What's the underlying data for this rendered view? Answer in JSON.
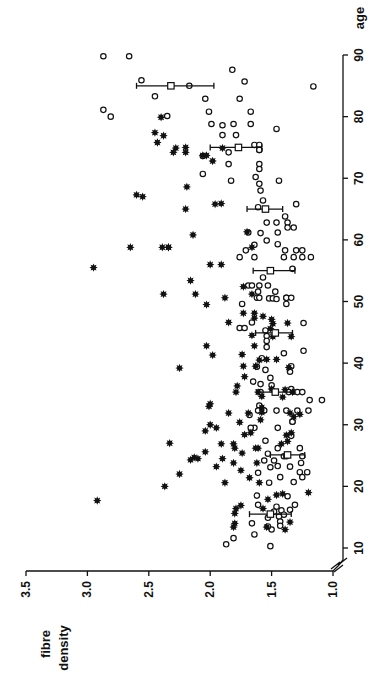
{
  "chart_data": {
    "type": "scatter",
    "orientation": "rotated-90-clockwise",
    "title": "",
    "xlabel": "age",
    "ylabel": "fibre density",
    "xlim": [
      10,
      90
    ],
    "ylim": [
      1.0,
      3.5
    ],
    "y_axis_break": true,
    "grid": false,
    "legend": null,
    "x_ticks": [
      10,
      20,
      30,
      40,
      50,
      60,
      70,
      80,
      90
    ],
    "x_tick_labels": [
      "10",
      "20",
      "30",
      "40",
      "50",
      "60",
      "70",
      "80",
      "90"
    ],
    "y_ticks": [
      1.0,
      1.5,
      2.0,
      2.5,
      3.0,
      3.5
    ],
    "y_tick_labels": [
      "1.0",
      "1.5",
      "2.0",
      "2.5",
      "3.0",
      "3.5"
    ],
    "colors": {
      "ink": "#111111",
      "background": "#ffffff"
    },
    "series": [
      {
        "name": "open circles",
        "marker": "open-circle",
        "points": [
          [
            89.8,
            2.87
          ],
          [
            89.8,
            2.66
          ],
          [
            85.9,
            2.56
          ],
          [
            83.3,
            2.45
          ],
          [
            81.1,
            2.87
          ],
          [
            80.0,
            2.81
          ],
          [
            80.1,
            2.35
          ],
          [
            85.0,
            2.17
          ],
          [
            84.9,
            1.16
          ],
          [
            87.6,
            1.82
          ],
          [
            85.7,
            1.72
          ],
          [
            82.9,
            2.04
          ],
          [
            82.9,
            1.76
          ],
          [
            80.8,
            2.01
          ],
          [
            80.8,
            1.67
          ],
          [
            78.8,
            1.99
          ],
          [
            78.6,
            1.9
          ],
          [
            78.8,
            1.81
          ],
          [
            78.8,
            1.67
          ],
          [
            78.0,
            1.46
          ],
          [
            77.0,
            1.9
          ],
          [
            77.0,
            1.79
          ],
          [
            74.2,
            1.85
          ],
          [
            75.4,
            1.64
          ],
          [
            75.4,
            1.6
          ],
          [
            74.6,
            1.6
          ],
          [
            74.6,
            1.6
          ],
          [
            73.6,
            2.06
          ],
          [
            72.3,
            1.85
          ],
          [
            72.3,
            1.6
          ],
          [
            71.5,
            1.6
          ],
          [
            70.7,
            2.06
          ],
          [
            70.2,
            1.63
          ],
          [
            69.6,
            1.83
          ],
          [
            69.6,
            1.44
          ],
          [
            69.1,
            1.6
          ],
          [
            68.0,
            1.59
          ],
          [
            66.4,
            1.57
          ],
          [
            65.8,
            1.3
          ],
          [
            65.3,
            1.61
          ],
          [
            63.8,
            1.39
          ],
          [
            62.8,
            1.54
          ],
          [
            62.8,
            1.46
          ],
          [
            62.8,
            1.37
          ],
          [
            62.0,
            1.37
          ],
          [
            62.0,
            1.32
          ],
          [
            61.2,
            1.69
          ],
          [
            61.1,
            1.59
          ],
          [
            61.2,
            1.45
          ],
          [
            59.9,
            1.54
          ],
          [
            59.2,
            1.64
          ],
          [
            59.3,
            1.45
          ],
          [
            58.3,
            1.71
          ],
          [
            58.3,
            1.39
          ],
          [
            58.3,
            1.3
          ],
          [
            58.3,
            1.25
          ],
          [
            57.2,
            1.25
          ],
          [
            57.2,
            1.32
          ],
          [
            57.2,
            1.4
          ],
          [
            57.2,
            1.64
          ],
          [
            57.2,
            1.76
          ],
          [
            55.3,
            1.33
          ],
          [
            57.2,
            1.18
          ],
          [
            53.9,
            1.57
          ],
          [
            52.6,
            1.69
          ],
          [
            52.6,
            1.66
          ],
          [
            52.6,
            1.6
          ],
          [
            52.6,
            1.53
          ],
          [
            51.6,
            1.61
          ],
          [
            51.6,
            1.47
          ],
          [
            50.6,
            1.62
          ],
          [
            50.6,
            1.6
          ],
          [
            50.5,
            1.52
          ],
          [
            50.5,
            1.49
          ],
          [
            50.4,
            1.46
          ],
          [
            50.6,
            1.38
          ],
          [
            50.6,
            1.38
          ],
          [
            50.6,
            1.34
          ],
          [
            49.6,
            1.38
          ],
          [
            49.6,
            1.74
          ],
          [
            46.6,
            1.66
          ],
          [
            46.5,
            1.24
          ],
          [
            45.7,
            1.76
          ],
          [
            45.7,
            1.72
          ],
          [
            45.3,
            1.55
          ],
          [
            44.4,
            1.54
          ],
          [
            42.0,
            1.24
          ],
          [
            43.6,
            1.54
          ],
          [
            42.6,
            1.54
          ],
          [
            41.6,
            1.4
          ],
          [
            40.8,
            1.58
          ],
          [
            39.5,
            1.34
          ],
          [
            39.4,
            1.62
          ],
          [
            38.6,
            1.35
          ],
          [
            38.9,
            1.55
          ],
          [
            37.6,
            1.51
          ],
          [
            37.0,
            1.65
          ],
          [
            36.4,
            1.5
          ],
          [
            36.6,
            1.59
          ],
          [
            35.8,
            1.34
          ],
          [
            35.3,
            1.36
          ],
          [
            35.3,
            1.29
          ],
          [
            35.3,
            1.25
          ],
          [
            35.3,
            1.59
          ],
          [
            34.0,
            1.19
          ],
          [
            34.0,
            1.09
          ],
          [
            33.1,
            1.6
          ],
          [
            32.3,
            1.61
          ],
          [
            32.3,
            1.56
          ],
          [
            32.3,
            1.46
          ],
          [
            32.3,
            1.38
          ],
          [
            32.3,
            1.29
          ],
          [
            32.3,
            1.2
          ],
          [
            30.5,
            1.33
          ],
          [
            30.5,
            1.33
          ],
          [
            29.5,
            1.64
          ],
          [
            29.5,
            1.67
          ],
          [
            31.6,
            1.68
          ],
          [
            29.5,
            1.45
          ],
          [
            28.2,
            1.34
          ],
          [
            27.4,
            1.55
          ],
          [
            26.2,
            1.45
          ],
          [
            26.2,
            1.27
          ],
          [
            25.3,
            1.53
          ],
          [
            24.9,
            1.4
          ],
          [
            24.9,
            1.25
          ],
          [
            24.9,
            1.38
          ],
          [
            24.2,
            1.48
          ],
          [
            24.2,
            1.56
          ],
          [
            23.8,
            1.26
          ],
          [
            23.3,
            1.45
          ],
          [
            23.1,
            1.51
          ],
          [
            22.2,
            1.61
          ],
          [
            22.3,
            1.27
          ],
          [
            22.3,
            1.21
          ],
          [
            23.2,
            1.35
          ],
          [
            21.5,
            1.43
          ],
          [
            21.5,
            1.25
          ],
          [
            20.7,
            1.32
          ],
          [
            20.6,
            1.52
          ],
          [
            18.4,
            1.37
          ],
          [
            18.5,
            1.62
          ],
          [
            17.0,
            1.61
          ],
          [
            17.0,
            1.31
          ],
          [
            16.7,
            1.46
          ],
          [
            16.1,
            1.42
          ],
          [
            16.2,
            1.35
          ],
          [
            15.4,
            1.4
          ],
          [
            15.9,
            1.48
          ],
          [
            15.1,
            1.44
          ],
          [
            14.9,
            1.53
          ],
          [
            14.3,
            1.43
          ],
          [
            13.6,
            1.43
          ],
          [
            13.0,
            1.5
          ],
          [
            13.5,
            1.53
          ],
          [
            12.2,
            1.64
          ],
          [
            11.6,
            1.81
          ],
          [
            10.6,
            1.87
          ],
          [
            10.3,
            1.51
          ],
          [
            14.0,
            1.66
          ]
        ]
      },
      {
        "name": "filled stars",
        "marker": "filled-star",
        "points": [
          [
            79.9,
            2.4
          ],
          [
            77.4,
            2.45
          ],
          [
            76.9,
            2.38
          ],
          [
            75.8,
            2.43
          ],
          [
            74.9,
            2.28
          ],
          [
            75.0,
            2.2
          ],
          [
            74.9,
            1.9
          ],
          [
            74.2,
            2.3
          ],
          [
            74.2,
            2.2
          ],
          [
            73.7,
            2.06
          ],
          [
            73.7,
            2.03
          ],
          [
            72.8,
            1.98
          ],
          [
            67.3,
            2.6
          ],
          [
            67.0,
            2.55
          ],
          [
            68.6,
            2.19
          ],
          [
            65.8,
            1.96
          ],
          [
            65.9,
            1.91
          ],
          [
            65.0,
            2.2
          ],
          [
            61.3,
            1.7
          ],
          [
            60.8,
            2.14
          ],
          [
            58.8,
            2.39
          ],
          [
            58.8,
            2.34
          ],
          [
            58.8,
            2.34
          ],
          [
            58.8,
            2.65
          ],
          [
            58.8,
            1.66
          ],
          [
            56.0,
            2.0
          ],
          [
            56.0,
            1.91
          ],
          [
            55.5,
            2.95
          ],
          [
            53.4,
            2.16
          ],
          [
            52.4,
            1.73
          ],
          [
            51.2,
            2.38
          ],
          [
            51.2,
            2.12
          ],
          [
            51.2,
            1.66
          ],
          [
            50.6,
            1.88
          ],
          [
            49.5,
            2.03
          ],
          [
            48.1,
            1.73
          ],
          [
            48.1,
            1.64
          ],
          [
            47.6,
            1.57
          ],
          [
            47.1,
            1.5
          ],
          [
            47.3,
            1.64
          ],
          [
            46.6,
            1.85
          ],
          [
            46.5,
            1.37
          ],
          [
            46.4,
            1.49
          ],
          [
            45.6,
            1.51
          ],
          [
            44.5,
            1.66
          ],
          [
            44.3,
            1.49
          ],
          [
            44.3,
            1.34
          ],
          [
            42.8,
            2.03
          ],
          [
            42.8,
            1.64
          ],
          [
            41.3,
            1.98
          ],
          [
            41.4,
            1.74
          ],
          [
            40.5,
            1.6
          ],
          [
            40.6,
            1.46
          ],
          [
            40.6,
            1.54
          ],
          [
            39.5,
            1.63
          ],
          [
            39.2,
            2.25
          ],
          [
            39.3,
            1.36
          ],
          [
            37.8,
            1.72
          ],
          [
            36.3,
            1.78
          ],
          [
            35.8,
            1.5
          ],
          [
            35.7,
            1.39
          ],
          [
            35.3,
            1.61
          ],
          [
            35.3,
            1.33
          ],
          [
            34.5,
            1.41
          ],
          [
            34.6,
            1.58
          ],
          [
            33.4,
            2.0
          ],
          [
            33.0,
            2.01
          ],
          [
            32.8,
            1.58
          ],
          [
            32.0,
            1.58
          ],
          [
            31.9,
            1.85
          ],
          [
            31.9,
            1.69
          ],
          [
            31.9,
            1.35
          ],
          [
            31.3,
            1.32
          ],
          [
            31.7,
            1.27
          ],
          [
            30.8,
            1.59
          ],
          [
            30.4,
            1.76
          ],
          [
            30.0,
            2.0
          ],
          [
            29.5,
            1.95
          ],
          [
            29.0,
            2.04
          ],
          [
            28.7,
            1.67
          ],
          [
            28.3,
            1.38
          ],
          [
            28.4,
            1.72
          ],
          [
            28.7,
            1.34
          ],
          [
            27.3,
            1.37
          ],
          [
            27.0,
            2.33
          ],
          [
            26.9,
            1.91
          ],
          [
            26.9,
            1.42
          ],
          [
            26.9,
            1.81
          ],
          [
            26.2,
            1.8
          ],
          [
            26.2,
            1.61
          ],
          [
            26.2,
            1.63
          ],
          [
            25.6,
            2.04
          ],
          [
            25.4,
            1.74
          ],
          [
            24.7,
            2.13
          ],
          [
            24.5,
            1.9
          ],
          [
            24.5,
            2.1
          ],
          [
            24.3,
            2.16
          ],
          [
            23.8,
            1.81
          ],
          [
            23.8,
            1.62
          ],
          [
            23.2,
            1.95
          ],
          [
            22.6,
            1.75
          ],
          [
            22.0,
            2.25
          ],
          [
            21.4,
            1.68
          ],
          [
            20.6,
            1.6
          ],
          [
            20.6,
            1.88
          ],
          [
            20.0,
            2.37
          ],
          [
            19.0,
            1.2
          ],
          [
            18.8,
            1.41
          ],
          [
            18.6,
            1.46
          ],
          [
            17.9,
            1.53
          ],
          [
            16.9,
            1.75
          ],
          [
            16.4,
            1.57
          ],
          [
            16.4,
            1.79
          ],
          [
            15.6,
            1.8
          ],
          [
            14.0,
            1.8
          ],
          [
            13.4,
            1.81
          ],
          [
            13.4,
            1.54
          ],
          [
            14.2,
            1.35
          ],
          [
            13.0,
            1.39
          ],
          [
            17.7,
            2.92
          ],
          [
            35.3,
            1.79
          ],
          [
            39.5,
            1.73
          ]
        ]
      },
      {
        "name": "decade means",
        "marker": "open-square",
        "points": [
          [
            15.5,
            1.51
          ],
          [
            25.1,
            1.37
          ],
          [
            35.3,
            1.47
          ],
          [
            44.9,
            1.47
          ],
          [
            55.0,
            1.51
          ],
          [
            65.0,
            1.55
          ],
          [
            75.0,
            1.77
          ],
          [
            85.0,
            2.32
          ]
        ],
        "error_bars": [
          [
            1.34,
            1.68
          ],
          [
            1.23,
            1.51
          ],
          [
            1.32,
            1.62
          ],
          [
            1.33,
            1.63
          ],
          [
            1.31,
            1.65
          ],
          [
            1.41,
            1.7
          ],
          [
            1.58,
            2.0
          ],
          [
            1.97,
            2.6
          ]
        ]
      }
    ]
  },
  "axes": {
    "x_title": "age",
    "y_title_line1": "fibre",
    "y_title_line2": "density"
  }
}
